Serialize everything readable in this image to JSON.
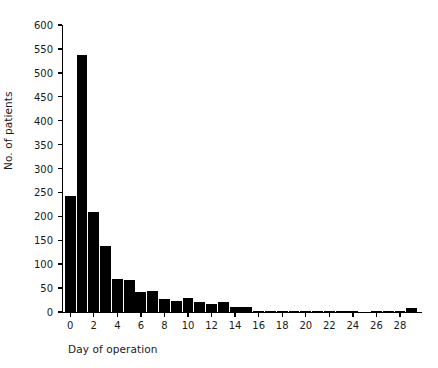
{
  "chart_data": {
    "type": "bar",
    "title": "",
    "subtitle": "",
    "xlabel": "Day of operation",
    "ylabel": "No. of patients",
    "xlim": [
      -0.7,
      29.7
    ],
    "ylim": [
      0,
      600
    ],
    "grid": false,
    "legend": null,
    "legend_position": "none",
    "bar_color": "#000000",
    "axis_color": "#000000",
    "y_ticks": [
      0,
      50,
      100,
      150,
      200,
      250,
      300,
      350,
      400,
      450,
      500,
      550,
      600
    ],
    "y_tick_labels": [
      "0",
      "50",
      "100",
      "150",
      "200",
      "250",
      "300",
      "350",
      "400",
      "450",
      "500",
      "550",
      "600"
    ],
    "x_ticks": [
      0,
      2,
      4,
      6,
      8,
      10,
      12,
      14,
      16,
      18,
      20,
      22,
      24,
      26,
      28
    ],
    "x_tick_labels": [
      "0",
      "2",
      "4",
      "6",
      "8",
      "10",
      "12",
      "14",
      "16",
      "18",
      "20",
      "22",
      "24",
      "26",
      "28"
    ],
    "categories": [
      0,
      1,
      2,
      3,
      4,
      5,
      6,
      7,
      8,
      9,
      10,
      11,
      12,
      13,
      14,
      15,
      16,
      17,
      18,
      19,
      20,
      21,
      22,
      23,
      24,
      25,
      26,
      27,
      28,
      29
    ],
    "values": [
      243,
      537,
      209,
      139,
      69,
      66,
      41,
      43,
      27,
      24,
      30,
      20,
      17,
      20,
      11,
      11,
      3,
      3,
      1,
      1,
      1,
      1,
      1,
      1,
      2,
      0,
      1,
      1,
      1,
      8
    ],
    "series": [
      {
        "name": "No. of patients",
        "values": [
          243,
          537,
          209,
          139,
          69,
          66,
          41,
          43,
          27,
          24,
          30,
          20,
          17,
          20,
          11,
          11,
          3,
          3,
          1,
          1,
          1,
          1,
          1,
          1,
          2,
          0,
          1,
          1,
          1,
          8
        ]
      }
    ]
  }
}
